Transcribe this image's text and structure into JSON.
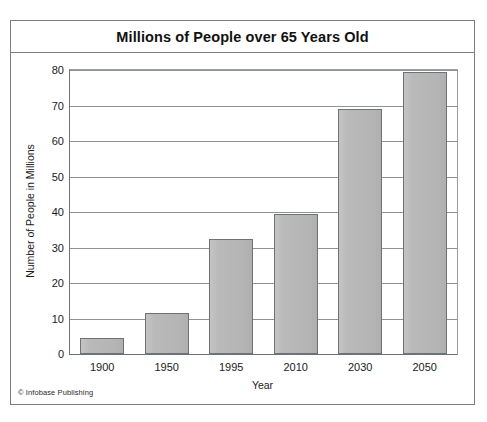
{
  "figure": {
    "title": "Millions of People over 65 Years Old",
    "credit": "© Infobase Publishing",
    "frame_color": "#7a7d82",
    "bar_fill": "#b9b9b9",
    "bar_border": "#6e7175",
    "gridline_color": "#8f9296"
  },
  "chart_data": {
    "type": "bar",
    "title": "Millions of People over 65 Years Old",
    "subtitle": "",
    "xlabel": "Year",
    "ylabel": "Number of People in Millions",
    "categories": [
      "1900",
      "1950",
      "1995",
      "2010",
      "2030",
      "2050"
    ],
    "values": [
      4.5,
      11.5,
      32.5,
      39.5,
      69,
      79.5
    ],
    "ylim": [
      0,
      80
    ],
    "ytick_labels": [
      "0",
      "10",
      "20",
      "30",
      "40",
      "50",
      "60",
      "70",
      "80"
    ],
    "ytick_values": [
      0,
      10,
      20,
      30,
      40,
      50,
      60,
      70,
      80
    ],
    "grid": true,
    "grid_axis": "y",
    "legend": false,
    "legend_position": "none",
    "annotations": [
      "© Infobase Publishing"
    ]
  }
}
